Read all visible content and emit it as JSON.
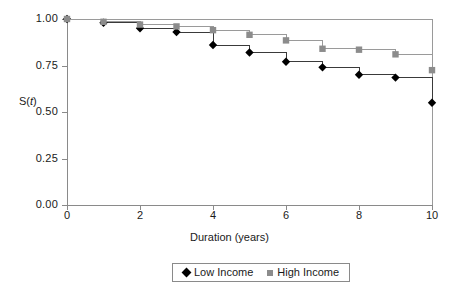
{
  "chart_data": {
    "type": "line",
    "title": "",
    "subtitle": "",
    "xlabel": "Duration (years)",
    "ylabel": "S(t)",
    "xlim": [
      0,
      10
    ],
    "ylim": [
      0,
      1.0
    ],
    "xticks": [
      "0",
      "2",
      "4",
      "6",
      "8",
      "10"
    ],
    "xtick_values": [
      0,
      2,
      4,
      6,
      8,
      10
    ],
    "yticks": [
      "0.00",
      "0.25",
      "0.50",
      "0.75",
      "1.00"
    ],
    "ytick_values": [
      0.0,
      0.25,
      0.5,
      0.75,
      1.0
    ],
    "grid": false,
    "step_style": "post",
    "legend_position": "bottom-center",
    "x": [
      0,
      1,
      2,
      3,
      4,
      5,
      6,
      7,
      8,
      9,
      10
    ],
    "series": [
      {
        "name": "Low Income",
        "marker": "diamond",
        "color": "#000000",
        "line_color": "#3a3a3a",
        "values": [
          1.0,
          0.98,
          0.95,
          0.93,
          0.86,
          0.82,
          0.77,
          0.74,
          0.7,
          0.685,
          0.55
        ]
      },
      {
        "name": "High Income",
        "marker": "square",
        "color": "#8c8c8c",
        "line_color": "#9a9a9a",
        "values": [
          1.0,
          0.985,
          0.97,
          0.96,
          0.94,
          0.915,
          0.885,
          0.84,
          0.835,
          0.81,
          0.725
        ]
      }
    ]
  },
  "legend": {
    "items": [
      {
        "label": "Low Income",
        "marker": "diamond",
        "color": "#000000"
      },
      {
        "label": "High Income",
        "marker": "square",
        "color": "#8c8c8c"
      }
    ]
  },
  "axis": {
    "y_label_text": "S(t)",
    "y_label_prefix": "S(",
    "y_label_italic": "t",
    "y_label_suffix": ")"
  },
  "colors": {
    "axis": "#8a8a8a",
    "frame": "#9a9a9a",
    "low_income": "#000000",
    "high_income": "#8c8c8c",
    "background": "#ffffff",
    "text": "#1a1a1a"
  }
}
